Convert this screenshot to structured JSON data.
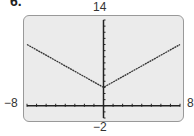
{
  "problem_number": "6.",
  "chart_data": {
    "type": "line",
    "title": "",
    "xlabel": "",
    "ylabel": "",
    "xlim": [
      -8,
      8
    ],
    "ylim": [
      -2,
      14
    ],
    "x_tick_labels": {
      "min": "−8",
      "max": "8"
    },
    "y_tick_labels": {
      "min": "−2",
      "max": "14"
    },
    "grid": false,
    "axis_ticks_every": 1,
    "series": [
      {
        "name": "graph",
        "x": [
          -8,
          0,
          8
        ],
        "y": [
          10,
          3,
          10
        ]
      }
    ],
    "colors": {
      "screen": "#ebebeb",
      "line": "#333333",
      "axes": "#222222"
    }
  }
}
